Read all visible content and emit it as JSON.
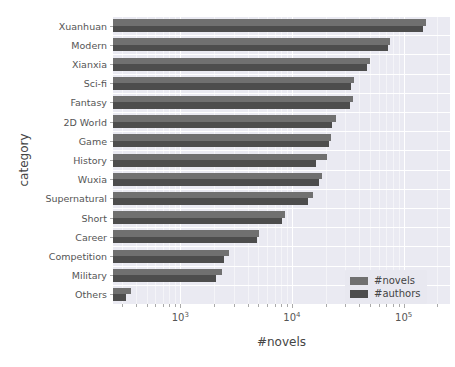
{
  "chart_data": {
    "type": "bar",
    "orientation": "horizontal",
    "title": "",
    "xlabel": "#novels",
    "ylabel": "category",
    "xscale": "log",
    "xlim": [
      250,
      260000
    ],
    "grid": true,
    "legend_position": "lower right",
    "xticks": [
      {
        "value": 1000,
        "label": "10",
        "exp": "3"
      },
      {
        "value": 10000,
        "label": "10",
        "exp": "4"
      },
      {
        "value": 100000,
        "label": "10",
        "exp": "5"
      }
    ],
    "categories": [
      "Xuanhuan",
      "Modern",
      "Xianxia",
      "Sci-fi",
      "Fantasy",
      "2D World",
      "Game",
      "History",
      "Wuxia",
      "Supernatural",
      "Short",
      "Career",
      "Competition",
      "Military",
      "Others"
    ],
    "series": [
      {
        "name": "#novels",
        "color": "#707070",
        "values": [
          160000,
          76000,
          50000,
          36000,
          35000,
          25000,
          22500,
          20500,
          18500,
          15500,
          8600,
          5100,
          2750,
          2350,
          360
        ]
      },
      {
        "name": "#authors",
        "color": "#4d4d4d",
        "values": [
          150000,
          73000,
          47000,
          34000,
          33000,
          23000,
          21500,
          16500,
          17500,
          14000,
          8200,
          4900,
          2450,
          2100,
          330
        ]
      }
    ]
  },
  "legend": {
    "items": [
      {
        "label": "#novels",
        "color": "#707070"
      },
      {
        "label": "#authors",
        "color": "#4d4d4d"
      }
    ]
  }
}
